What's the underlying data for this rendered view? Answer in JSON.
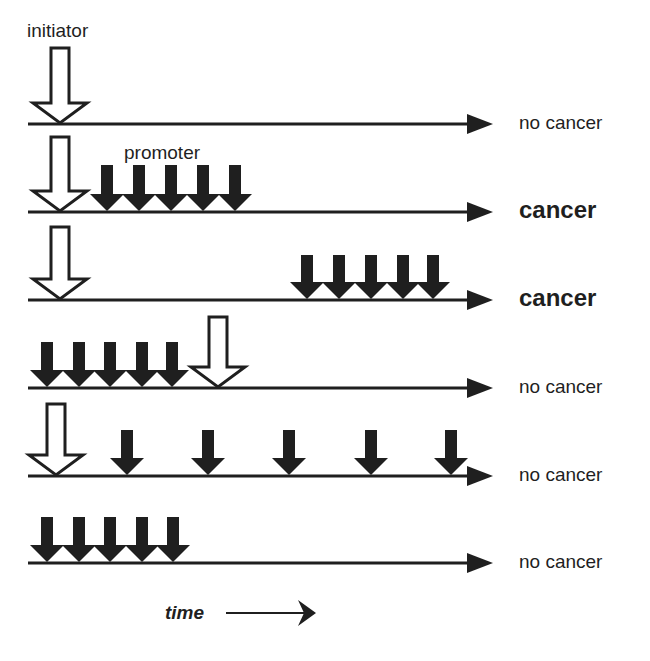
{
  "colors": {
    "ink": "#1f1f1f",
    "background": "#ffffff"
  },
  "labels": {
    "initiator": "initiator",
    "promoter": "promoter",
    "time": "time"
  },
  "timeline": {
    "x_start": 28,
    "x_end": 493
  },
  "rows": [
    {
      "line_y": 124,
      "outcome": "no cancer",
      "outcome_bold": false,
      "initiators": [
        {
          "x": 60,
          "top": 48
        }
      ],
      "promoters": []
    },
    {
      "line_y": 212,
      "outcome": "cancer",
      "outcome_bold": true,
      "initiators": [
        {
          "x": 60,
          "top": 137
        }
      ],
      "promoters": [
        {
          "x": 107,
          "top": 165
        },
        {
          "x": 139,
          "top": 165
        },
        {
          "x": 171,
          "top": 165
        },
        {
          "x": 203,
          "top": 165
        },
        {
          "x": 235,
          "top": 165
        }
      ]
    },
    {
      "line_y": 300,
      "outcome": "cancer",
      "outcome_bold": true,
      "initiators": [
        {
          "x": 60,
          "top": 227
        }
      ],
      "promoters": [
        {
          "x": 307,
          "top": 255
        },
        {
          "x": 339,
          "top": 255
        },
        {
          "x": 371,
          "top": 255
        },
        {
          "x": 403,
          "top": 255
        },
        {
          "x": 433,
          "top": 255
        }
      ]
    },
    {
      "line_y": 388,
      "outcome": "no cancer",
      "outcome_bold": false,
      "initiators": [
        {
          "x": 218,
          "top": 317
        }
      ],
      "promoters": [
        {
          "x": 47,
          "top": 342
        },
        {
          "x": 79,
          "top": 342
        },
        {
          "x": 110,
          "top": 342
        },
        {
          "x": 142,
          "top": 342
        },
        {
          "x": 172,
          "top": 342
        }
      ]
    },
    {
      "line_y": 476,
      "outcome": "no cancer",
      "outcome_bold": false,
      "initiators": [
        {
          "x": 56,
          "top": 404
        }
      ],
      "promoters": [
        {
          "x": 127,
          "top": 430
        },
        {
          "x": 208,
          "top": 430
        },
        {
          "x": 289,
          "top": 430
        },
        {
          "x": 371,
          "top": 430
        },
        {
          "x": 451,
          "top": 430
        }
      ]
    },
    {
      "line_y": 563,
      "outcome": "no cancer",
      "outcome_bold": false,
      "initiators": [],
      "promoters": [
        {
          "x": 47,
          "top": 517
        },
        {
          "x": 79,
          "top": 517
        },
        {
          "x": 110,
          "top": 517
        },
        {
          "x": 142,
          "top": 517
        },
        {
          "x": 173,
          "top": 517
        }
      ]
    }
  ]
}
